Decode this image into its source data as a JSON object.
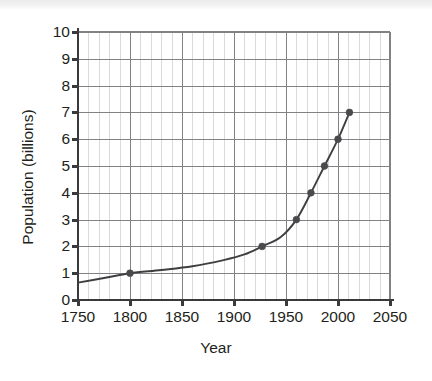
{
  "chart_data": {
    "type": "line",
    "title": "",
    "xlabel": "Year",
    "ylabel": "Population (billions)",
    "xlim": [
      1750,
      2050
    ],
    "ylim": [
      0,
      10
    ],
    "xticks": [
      1750,
      1800,
      1850,
      1900,
      1950,
      2000,
      2050
    ],
    "xtick_labels": [
      "1750",
      "1800",
      "1850",
      "1900",
      "1950",
      "2000",
      "2050"
    ],
    "yticks": [
      0,
      1,
      2,
      3,
      4,
      5,
      6,
      7,
      8,
      9,
      10
    ],
    "ytick_labels": [
      "0",
      "1",
      "2",
      "3",
      "4",
      "5",
      "6",
      "7",
      "8",
      "9",
      "10"
    ],
    "grid": true,
    "grid_major_color": "#808285",
    "grid_minor_color": "#d9dadb",
    "minor_x_step": 10,
    "legend": null,
    "line_color": "#3f3f41",
    "marker_color": "#4a4a4c",
    "marker": "circle",
    "series": [
      {
        "name": "World population",
        "x": [
          1750,
          1800,
          1927,
          1960,
          1974,
          1987,
          2000,
          2011
        ],
        "y": [
          0.65,
          1.0,
          2.0,
          3.0,
          4.0,
          5.0,
          6.0,
          7.0
        ],
        "markers_shown": [
          false,
          true,
          true,
          true,
          true,
          true,
          true,
          true
        ]
      }
    ],
    "curve_path_points": [
      [
        1750,
        0.65
      ],
      [
        1775,
        0.82
      ],
      [
        1800,
        1.0
      ],
      [
        1830,
        1.12
      ],
      [
        1860,
        1.26
      ],
      [
        1890,
        1.49
      ],
      [
        1910,
        1.7
      ],
      [
        1927,
        2.0
      ],
      [
        1945,
        2.35
      ],
      [
        1960,
        3.0
      ],
      [
        1974,
        4.0
      ],
      [
        1987,
        5.0
      ],
      [
        2000,
        6.0
      ],
      [
        2011,
        7.0
      ]
    ]
  },
  "axes": {
    "y_axis_label": "Population (billions)",
    "x_axis_label": "Year"
  }
}
